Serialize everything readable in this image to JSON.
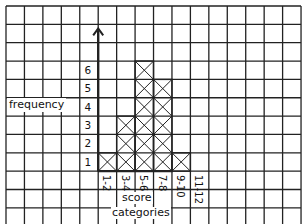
{
  "chart_data": {
    "type": "bar",
    "style": "hand-drawn histogram on grid paper, bars filled with X cross-hatch per cell",
    "categories": [
      "1-2",
      "3-4",
      "5-6",
      "7-8",
      "9-10",
      "11-12"
    ],
    "values": [
      1,
      3,
      6,
      5,
      1,
      0
    ],
    "title": "",
    "xlabel": "score categories",
    "ylabel": "frequency",
    "y_ticks": [
      "1",
      "2",
      "3",
      "4",
      "5",
      "6"
    ],
    "ylim": [
      0,
      6
    ],
    "grid": true,
    "legend": null
  },
  "labels": {
    "ylabel": "frequency",
    "xlabel_line1": "score",
    "xlabel_line2": "categories"
  },
  "colors": {
    "grid": "#222222",
    "background": "#ffffff",
    "ink": "#111111"
  }
}
